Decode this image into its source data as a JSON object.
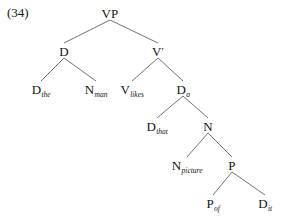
{
  "example": {
    "number_label": "(34)"
  },
  "figure": {
    "type": "syntax-tree",
    "background_color": "#ffffff",
    "text_color": "#141414",
    "edge_color": "#5a5a5a"
  },
  "tree": {
    "nodes": [
      {
        "id": "vp",
        "label": "VP",
        "subscript": "",
        "prime": false,
        "x": 110,
        "y": 13
      },
      {
        "id": "d",
        "label": "D",
        "subscript": "",
        "prime": false,
        "x": 64,
        "y": 51
      },
      {
        "id": "vbar",
        "label": "V",
        "subscript": "",
        "prime": true,
        "x": 158,
        "y": 51
      },
      {
        "id": "d-the",
        "label": "D",
        "subscript": "the",
        "prime": false,
        "x": 41,
        "y": 89
      },
      {
        "id": "n-man",
        "label": "N",
        "subscript": "man",
        "prime": false,
        "x": 96,
        "y": 89
      },
      {
        "id": "v-likes",
        "label": "V",
        "subscript": "likes",
        "prime": false,
        "x": 132,
        "y": 89
      },
      {
        "id": "d-a",
        "label": "D",
        "subscript": "a",
        "prime": false,
        "x": 183,
        "y": 89
      },
      {
        "id": "d-that",
        "label": "D",
        "subscript": "that",
        "prime": false,
        "x": 157,
        "y": 126
      },
      {
        "id": "n",
        "label": "N",
        "subscript": "",
        "prime": false,
        "x": 208,
        "y": 126
      },
      {
        "id": "n-picture",
        "label": "N",
        "subscript": "picture",
        "prime": false,
        "x": 187,
        "y": 165
      },
      {
        "id": "p",
        "label": "P",
        "subscript": "",
        "prime": false,
        "x": 232,
        "y": 165
      },
      {
        "id": "p-of",
        "label": "P",
        "subscript": "of",
        "prime": false,
        "x": 213,
        "y": 203
      },
      {
        "id": "d-it",
        "label": "D",
        "subscript": "it",
        "prime": false,
        "x": 265,
        "y": 203
      }
    ],
    "edges": [
      {
        "from": "vp",
        "to": "d"
      },
      {
        "from": "vp",
        "to": "vbar"
      },
      {
        "from": "d",
        "to": "d-the"
      },
      {
        "from": "d",
        "to": "n-man"
      },
      {
        "from": "vbar",
        "to": "v-likes"
      },
      {
        "from": "vbar",
        "to": "d-a"
      },
      {
        "from": "d-a",
        "to": "d-that"
      },
      {
        "from": "d-a",
        "to": "n"
      },
      {
        "from": "n",
        "to": "n-picture"
      },
      {
        "from": "n",
        "to": "p"
      },
      {
        "from": "p",
        "to": "p-of"
      },
      {
        "from": "p",
        "to": "d-it"
      }
    ]
  }
}
